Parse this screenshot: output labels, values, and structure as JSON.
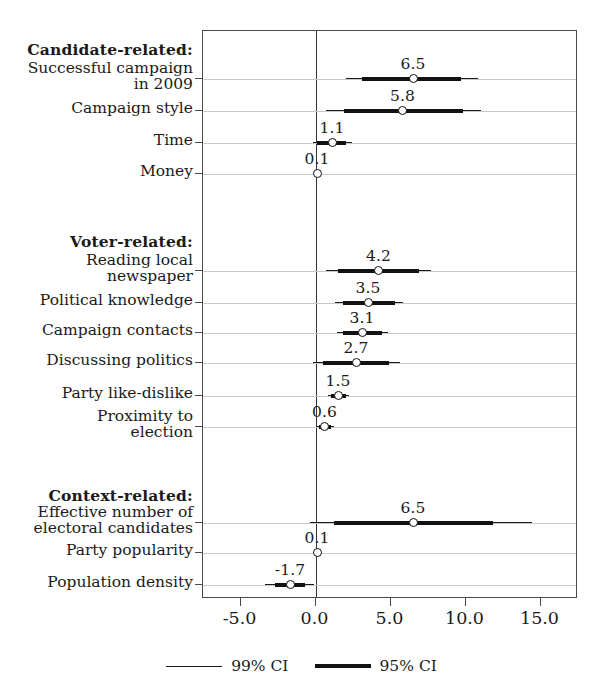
{
  "chart_data": {
    "type": "scatter",
    "title": "",
    "xlabel": "",
    "ylabel": "",
    "xlim": [
      -7.5,
      17.5
    ],
    "grid": true,
    "legend_position": "bottom",
    "xticks": [
      -5.0,
      0.0,
      5.0,
      10.0,
      15.0
    ],
    "xticklabels": [
      "-5.0",
      "0.0",
      "5.0",
      "10.0",
      "15.0"
    ],
    "zero_reference_line": 0.0,
    "groups": [
      {
        "label": "Candidate-related:",
        "rows": [
          {
            "label": "Successful campaign\nin 2009",
            "estimate": 6.5,
            "estimate_label": "6.5",
            "ci95": [
              3.1,
              9.7
            ],
            "ci99": [
              2.0,
              10.8
            ]
          },
          {
            "label": "Campaign style",
            "estimate": 5.8,
            "estimate_label": "5.8",
            "ci95": [
              1.9,
              9.8
            ],
            "ci99": [
              0.7,
              11.0
            ]
          },
          {
            "label": "Time",
            "estimate": 1.1,
            "estimate_label": "1.1",
            "ci95": [
              0.1,
              2.0
            ],
            "ci99": [
              -0.2,
              2.4
            ]
          },
          {
            "label": "Money",
            "estimate": 0.1,
            "estimate_label": "0.1",
            "ci95": [
              -0.1,
              0.3
            ],
            "ci99": [
              -0.2,
              0.4
            ]
          }
        ]
      },
      {
        "label": "Voter-related:",
        "rows": [
          {
            "label": "Reading local\nnewspaper",
            "estimate": 4.2,
            "estimate_label": "4.2",
            "ci95": [
              1.5,
              6.9
            ],
            "ci99": [
              0.7,
              7.7
            ]
          },
          {
            "label": "Political knowledge",
            "estimate": 3.5,
            "estimate_label": "3.5",
            "ci95": [
              1.8,
              5.3
            ],
            "ci99": [
              1.3,
              5.8
            ]
          },
          {
            "label": "Campaign contacts",
            "estimate": 3.1,
            "estimate_label": "3.1",
            "ci95": [
              1.8,
              4.4
            ],
            "ci99": [
              1.4,
              4.8
            ]
          },
          {
            "label": "Discussing politics",
            "estimate": 2.7,
            "estimate_label": "2.7",
            "ci95": [
              0.5,
              4.9
            ],
            "ci99": [
              -0.2,
              5.6
            ]
          },
          {
            "label": "Party like-dislike",
            "estimate": 1.5,
            "estimate_label": "1.5",
            "ci95": [
              1.0,
              2.0
            ],
            "ci99": [
              0.8,
              2.2
            ]
          },
          {
            "label": "Proximity to\nelection",
            "estimate": 0.6,
            "estimate_label": "0.6",
            "ci95": [
              0.2,
              1.0
            ],
            "ci99": [
              0.0,
              1.2
            ]
          }
        ]
      },
      {
        "label": "Context-related:",
        "rows": [
          {
            "label": "Effective number of\nelectoral candidates",
            "estimate": 6.5,
            "estimate_label": "6.5",
            "ci95": [
              1.2,
              11.8
            ],
            "ci99": [
              -0.4,
              14.4
            ]
          },
          {
            "label": "Party popularity",
            "estimate": 0.1,
            "estimate_label": "0.1",
            "ci95": [
              -0.1,
              0.3
            ],
            "ci99": [
              -0.2,
              0.4
            ]
          },
          {
            "label": "Population density",
            "estimate": -1.7,
            "estimate_label": "-1.7",
            "ci95": [
              -2.7,
              -0.7
            ],
            "ci99": [
              -3.4,
              -0.1
            ]
          }
        ]
      }
    ],
    "legend": [
      {
        "label": "99% CI",
        "style": "thin"
      },
      {
        "label": "95% CI",
        "style": "thick"
      }
    ]
  }
}
